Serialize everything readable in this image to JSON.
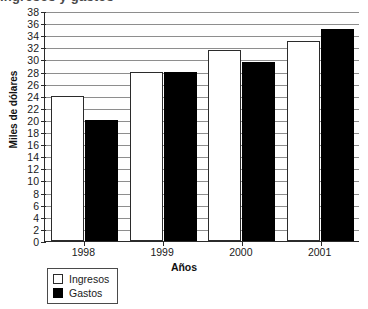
{
  "chart_data": {
    "type": "bar",
    "title": "Ingresos y gastos",
    "title_clipped": true,
    "categories": [
      "1998",
      "1999",
      "2000",
      "2001"
    ],
    "series": [
      {
        "name": "Ingresos",
        "color": "#ffffff",
        "values": [
          24,
          28,
          31.5,
          33
        ]
      },
      {
        "name": "Gastos",
        "color": "#000000",
        "values": [
          20,
          28,
          29.5,
          35
        ]
      }
    ],
    "xlabel": "Años",
    "ylabel": "Miles de dólares",
    "ylim": [
      0,
      38
    ],
    "ytick_step": 2,
    "yticks": [
      0,
      2,
      4,
      6,
      8,
      10,
      12,
      14,
      16,
      18,
      20,
      22,
      24,
      26,
      28,
      30,
      32,
      34,
      36,
      38
    ],
    "ytick_labels": [
      "0",
      "2",
      "4",
      "6",
      "8",
      "10",
      "12",
      "14",
      "16",
      "18",
      "20",
      "22",
      "24",
      "26",
      "28",
      "30",
      "32",
      "34",
      "36",
      "38"
    ],
    "grid": true,
    "grid_axis": "y",
    "legend_position": "bottom-left"
  }
}
